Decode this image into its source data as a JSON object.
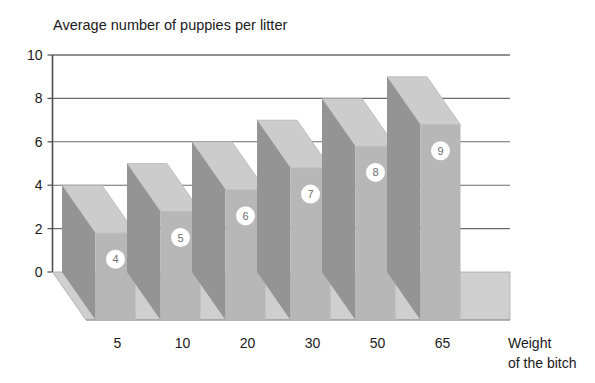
{
  "chart_data": {
    "type": "bar",
    "title": "Average number of puppies per litter",
    "subtitle": "",
    "xlabel": "Weight of the bitch",
    "xlabel_lines": [
      "Weight",
      "of the bitch"
    ],
    "ylabel": "",
    "categories": [
      "5",
      "10",
      "20",
      "30",
      "50",
      "65"
    ],
    "values": [
      4,
      5,
      6,
      7,
      8,
      9
    ],
    "data_labels": [
      "4",
      "5",
      "6",
      "7",
      "8",
      "9"
    ],
    "ylim": [
      0,
      10
    ],
    "yticks": [
      0,
      2,
      4,
      6,
      8,
      10
    ],
    "ytick_labels": [
      "0",
      "2",
      "4",
      "6",
      "8",
      "10"
    ],
    "grid": true,
    "grid_axis": "y",
    "legend": false,
    "legend_position": "none",
    "style": "3d-column",
    "colors": {
      "bar_front": "#b7b7b7",
      "bar_side": "#949494",
      "bar_top": "#cccccc",
      "floor": "#c4c4c4",
      "floor_top": "#d2d2d2",
      "axis": "#4d4d4d",
      "grid": "#6b6b6b",
      "badge_fill": "#ffffff",
      "badge_text": "#6e6e6e",
      "text": "#1a1a1a",
      "background": "#ffffff"
    }
  }
}
